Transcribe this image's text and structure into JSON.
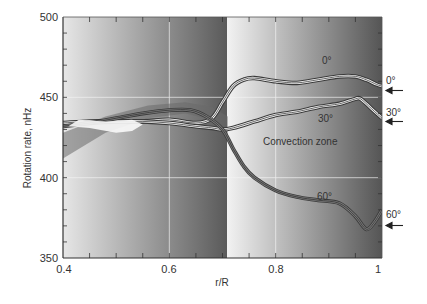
{
  "chart_data": {
    "type": "line",
    "title": "",
    "xlabel": "r/R",
    "ylabel": "Rotation rate, nHz",
    "xlim": [
      0.4,
      1.0
    ],
    "ylim": [
      350,
      500
    ],
    "xticks": [
      0.4,
      0.6,
      0.8,
      1
    ],
    "xtick_labels": [
      "0.4",
      "0.6",
      "0.8",
      "1"
    ],
    "yticks": [
      350,
      400,
      450,
      500
    ],
    "ytick_labels": [
      "350",
      "400",
      "450",
      "500"
    ],
    "grid": true,
    "annotation": "Convection zone",
    "convection_zone_boundary": 0.71,
    "series": [
      {
        "name": "0°",
        "x": [
          0.4,
          0.45,
          0.5,
          0.55,
          0.6,
          0.65,
          0.68,
          0.7,
          0.72,
          0.74,
          0.76,
          0.8,
          0.84,
          0.88,
          0.92,
          0.95,
          0.97,
          0.99,
          1.0
        ],
        "values": [
          433,
          434,
          435,
          435,
          436,
          434,
          437,
          447,
          457,
          461,
          462,
          460,
          459,
          461,
          463,
          463,
          461,
          458,
          457
        ],
        "surface_value": 453
      },
      {
        "name": "30°",
        "x": [
          0.4,
          0.45,
          0.5,
          0.55,
          0.6,
          0.65,
          0.68,
          0.7,
          0.72,
          0.76,
          0.8,
          0.84,
          0.88,
          0.92,
          0.95,
          0.96,
          0.98,
          1.0
        ],
        "values": [
          434,
          435,
          435,
          435,
          434,
          432,
          431,
          430,
          431,
          435,
          439,
          441,
          444,
          446,
          449,
          449,
          443,
          437
        ],
        "surface_value": 439
      },
      {
        "name": "60°",
        "x": [
          0.4,
          0.45,
          0.5,
          0.55,
          0.6,
          0.64,
          0.67,
          0.7,
          0.72,
          0.74,
          0.76,
          0.8,
          0.84,
          0.88,
          0.92,
          0.95,
          0.97,
          0.985,
          1.0
        ],
        "values": [
          432,
          434,
          437,
          440,
          442,
          442,
          438,
          430,
          418,
          407,
          400,
          392,
          388,
          386,
          384,
          376,
          368,
          372,
          380
        ],
        "surface_value": 373
      }
    ],
    "right_labels": [
      {
        "label": "0°",
        "value": 453
      },
      {
        "label": "30°",
        "value": 439
      },
      {
        "label": "60°",
        "value": 373
      }
    ]
  },
  "labels": {
    "ylabel": "Rotation rate, nHz",
    "xlabel": "r/R",
    "annotation": "Convection zone",
    "curve_0": "0°",
    "curve_30": "30°",
    "curve_60": "60°",
    "right_0": "0°",
    "right_30": "30°",
    "right_60": "60°",
    "x_0": "0.4",
    "x_1": "0.6",
    "x_2": "0.8",
    "x_3": "1",
    "y_0": "350",
    "y_1": "400",
    "y_2": "450",
    "y_3": "500"
  }
}
